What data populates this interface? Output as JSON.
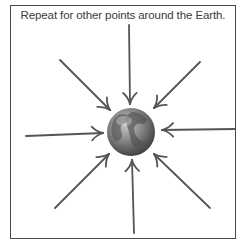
{
  "caption": "Repeat for other points around the Earth.",
  "diagram": {
    "center_label": "Earth",
    "center": [
      131,
      132
    ],
    "radius": 24,
    "arrow_count": 8,
    "arrow_color": "#555555",
    "frame_color": "#4a4a4a",
    "arrows": [
      {
        "name": "arrow-from-top",
        "from": [
          129,
          25
        ],
        "to": [
          130,
          104
        ]
      },
      {
        "name": "arrow-from-top-right",
        "from": [
          200,
          62
        ],
        "to": [
          154,
          108
        ]
      },
      {
        "name": "arrow-from-right",
        "from": [
          235,
          129
        ],
        "to": [
          162,
          130
        ]
      },
      {
        "name": "arrow-from-bottom-right",
        "from": [
          210,
          208
        ],
        "to": [
          154,
          154
        ]
      },
      {
        "name": "arrow-from-bottom",
        "from": [
          134,
          233
        ],
        "to": [
          132,
          160
        ]
      },
      {
        "name": "arrow-from-bottom-left",
        "from": [
          55,
          208
        ],
        "to": [
          109,
          154
        ]
      },
      {
        "name": "arrow-from-left",
        "from": [
          26,
          136
        ],
        "to": [
          103,
          133
        ]
      },
      {
        "name": "arrow-from-top-left",
        "from": [
          60,
          60
        ],
        "to": [
          110,
          110
        ]
      }
    ]
  }
}
